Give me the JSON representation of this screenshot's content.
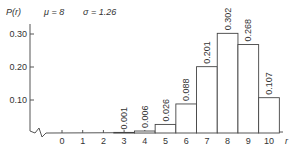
{
  "chart_data": {
    "type": "bar",
    "title": "",
    "ylabel": "P(r)",
    "xlabel": "r",
    "annotations": {
      "mu": "μ = 8",
      "sigma": "σ = 1.26"
    },
    "categories": [
      "0",
      "1",
      "2",
      "3",
      "4",
      "5",
      "6",
      "7",
      "8",
      "9",
      "10"
    ],
    "values": [
      0,
      0,
      0,
      0.001,
      0.006,
      0.026,
      0.088,
      0.201,
      0.302,
      0.268,
      0.107
    ],
    "value_labels": [
      "",
      "",
      "",
      "0.001",
      "0.006",
      "0.026",
      "0.088",
      "0.201",
      "0.302",
      "0.268",
      "0.107"
    ],
    "yticks": [
      "0.10",
      "0.20",
      "0.30"
    ],
    "ytick_values": [
      0.1,
      0.2,
      0.3
    ],
    "ylim": [
      0,
      0.32
    ],
    "grid": false,
    "legend": null,
    "axis_break": true
  },
  "colors": {
    "axis": "#555555",
    "bar_stroke": "#444444",
    "bar_fill": "#ffffff"
  }
}
